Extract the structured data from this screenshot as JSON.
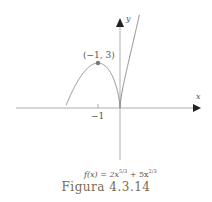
{
  "chart_data": {
    "type": "line",
    "title": "",
    "function": "f(x) = 2x^(5/3) + 5x^(2/3)",
    "xlabel": "x",
    "ylabel": "y",
    "x_ticks": [
      "-1"
    ],
    "annotations": [
      {
        "label": "(−1, 3)",
        "x": -1,
        "y": 3,
        "marker": "point"
      }
    ],
    "x_range": [
      -2.7,
      3.5
    ],
    "y_range": [
      -3.7,
      5.5
    ],
    "grid": false,
    "series": [
      {
        "name": "f(x)",
        "color": "#888888",
        "points": "curve of 2x^(5/3)+5x^(2/3), local max at (-1,3), cusp at (0,0)"
      }
    ]
  },
  "labels": {
    "x_axis": "x",
    "y_axis": "y",
    "tick_minus_one": "−1",
    "point": "(−1, 3)",
    "formula_f": "f(x) = 2x",
    "formula_exp1": "5/3",
    "formula_mid": " + 5x",
    "formula_exp2": "2/3",
    "caption": "Figura  4.3.14"
  }
}
